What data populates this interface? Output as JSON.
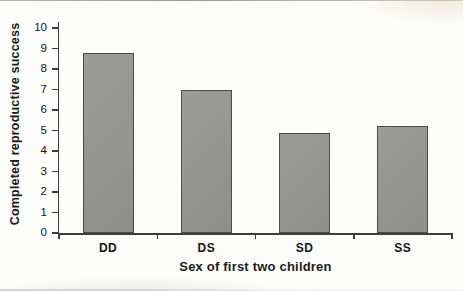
{
  "chart_data": {
    "type": "bar",
    "title": "",
    "categories": [
      "DD",
      "DS",
      "SD",
      "SS"
    ],
    "values": [
      8.8,
      7.0,
      4.9,
      5.2
    ],
    "xlabel": "Sex of first two children",
    "ylabel": "Completed reproductive success",
    "ylim": [
      0,
      10
    ],
    "yticks": [
      0,
      1,
      2,
      3,
      4,
      5,
      6,
      7,
      8,
      9,
      10
    ],
    "grid": false,
    "legend": false,
    "colors": {
      "bar_fill": "#949492",
      "bar_border": "#4c4c4c",
      "axis": "#3d3d3d",
      "background": "#fcfcfa",
      "text": "#1c1c1c"
    }
  }
}
